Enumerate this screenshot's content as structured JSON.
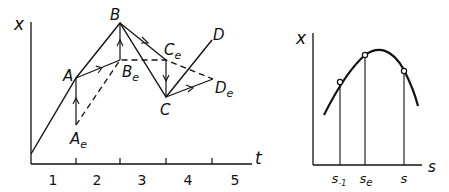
{
  "left_plot": {
    "y_axis_label": "x",
    "x_axis_label": "t",
    "x_ticks": [
      "1",
      "2",
      "3",
      "4",
      "5"
    ],
    "points": {
      "A": "A",
      "B": "B",
      "C": "C",
      "D": "D",
      "Ae": {
        "base": "A",
        "sub": "e"
      },
      "Be": {
        "base": "B",
        "sub": "e"
      },
      "Ce": {
        "base": "C",
        "sub": "e"
      },
      "De": {
        "base": "D",
        "sub": "e"
      }
    }
  },
  "right_plot": {
    "y_axis_label": "x",
    "x_axis_label": "s",
    "marks": [
      {
        "base": "s",
        "sub": "-1"
      },
      {
        "base": "s",
        "sub": "e"
      },
      {
        "base": "s",
        "sub": ""
      }
    ]
  },
  "colors": {
    "ink": "#111111",
    "background": "#ffffff"
  }
}
